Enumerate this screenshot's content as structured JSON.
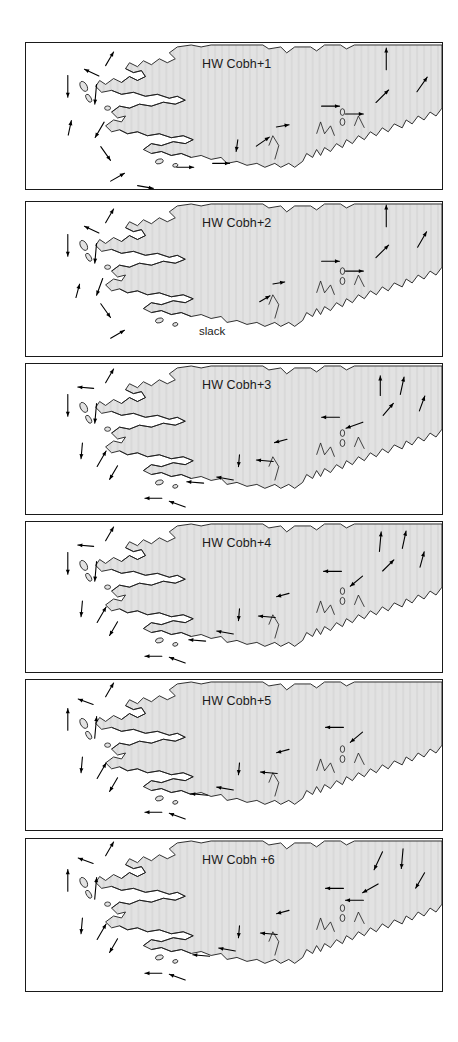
{
  "figure": {
    "title_implicit": "Tidal stream atlas relative to High Water Cobh",
    "width": 458,
    "height": 1042,
    "background_color": "#ffffff",
    "land_fill_color": "#e2e2e2",
    "coastline_color": "#1a1a1a",
    "arrow_color": "#000000",
    "panel_border_color": "#1a1a1a"
  },
  "panels": [
    {
      "id": "panel-1",
      "label": "HW Cobh+1",
      "annotation": "",
      "top": 42,
      "height": 148,
      "label_x": 176,
      "label_y": 14,
      "arrows": [
        {
          "x": 42,
          "y": 44,
          "angle": 90,
          "len": 22
        },
        {
          "x": 44,
          "y": 86,
          "angle": 282,
          "len": 15
        },
        {
          "x": 66,
          "y": 30,
          "angle": 205,
          "len": 16
        },
        {
          "x": 84,
          "y": 16,
          "angle": 300,
          "len": 16
        },
        {
          "x": 70,
          "y": 52,
          "angle": 95,
          "len": 20
        },
        {
          "x": 74,
          "y": 88,
          "angle": 120,
          "len": 18
        },
        {
          "x": 80,
          "y": 112,
          "angle": 55,
          "len": 17
        },
        {
          "x": 92,
          "y": 136,
          "angle": 330,
          "len": 16
        },
        {
          "x": 120,
          "y": 146,
          "angle": 10,
          "len": 16
        },
        {
          "x": 152,
          "y": 152,
          "angle": 5,
          "len": 16
        },
        {
          "x": 160,
          "y": 126,
          "angle": 0,
          "len": 17
        },
        {
          "x": 196,
          "y": 122,
          "angle": 0,
          "len": 17
        },
        {
          "x": 212,
          "y": 104,
          "angle": 98,
          "len": 12
        },
        {
          "x": 238,
          "y": 100,
          "angle": 325,
          "len": 16
        },
        {
          "x": 258,
          "y": 84,
          "angle": 350,
          "len": 13
        },
        {
          "x": 306,
          "y": 64,
          "angle": 0,
          "len": 18
        },
        {
          "x": 330,
          "y": 72,
          "angle": 0,
          "len": 18
        },
        {
          "x": 362,
          "y": 16,
          "angle": 270,
          "len": 22
        },
        {
          "x": 358,
          "y": 54,
          "angle": 315,
          "len": 18
        },
        {
          "x": 398,
          "y": 42,
          "angle": 305,
          "len": 18
        }
      ]
    },
    {
      "id": "panel-2",
      "label": "HW Cobh+2",
      "annotation": "slack",
      "annotation_x": 173,
      "annotation_y": 123,
      "top": 201,
      "height": 156,
      "label_x": 176,
      "label_y": 14,
      "arrows": [
        {
          "x": 42,
          "y": 44,
          "angle": 90,
          "len": 22
        },
        {
          "x": 66,
          "y": 28,
          "angle": 205,
          "len": 16
        },
        {
          "x": 84,
          "y": 14,
          "angle": 300,
          "len": 16
        },
        {
          "x": 70,
          "y": 52,
          "angle": 95,
          "len": 20
        },
        {
          "x": 74,
          "y": 86,
          "angle": 110,
          "len": 18
        },
        {
          "x": 52,
          "y": 90,
          "angle": 285,
          "len": 14
        },
        {
          "x": 80,
          "y": 110,
          "angle": 55,
          "len": 17
        },
        {
          "x": 92,
          "y": 134,
          "angle": 330,
          "len": 16
        },
        {
          "x": 240,
          "y": 98,
          "angle": 330,
          "len": 12
        },
        {
          "x": 254,
          "y": 82,
          "angle": 350,
          "len": 12
        },
        {
          "x": 306,
          "y": 60,
          "angle": 0,
          "len": 18
        },
        {
          "x": 330,
          "y": 70,
          "angle": 0,
          "len": 18
        },
        {
          "x": 362,
          "y": 14,
          "angle": 270,
          "len": 22
        },
        {
          "x": 358,
          "y": 50,
          "angle": 315,
          "len": 18
        },
        {
          "x": 398,
          "y": 38,
          "angle": 300,
          "len": 18
        }
      ]
    },
    {
      "id": "panel-3",
      "label": "HW Cobh+3",
      "annotation": "",
      "top": 363,
      "height": 152,
      "label_x": 176,
      "label_y": 14,
      "arrows": [
        {
          "x": 42,
          "y": 42,
          "angle": 90,
          "len": 22
        },
        {
          "x": 60,
          "y": 24,
          "angle": 185,
          "len": 16
        },
        {
          "x": 84,
          "y": 12,
          "angle": 300,
          "len": 16
        },
        {
          "x": 70,
          "y": 50,
          "angle": 95,
          "len": 20
        },
        {
          "x": 56,
          "y": 88,
          "angle": 95,
          "len": 16
        },
        {
          "x": 76,
          "y": 96,
          "angle": 300,
          "len": 18
        },
        {
          "x": 88,
          "y": 110,
          "angle": 120,
          "len": 16
        },
        {
          "x": 128,
          "y": 136,
          "angle": 180,
          "len": 17
        },
        {
          "x": 152,
          "y": 142,
          "angle": 200,
          "len": 17
        },
        {
          "x": 170,
          "y": 120,
          "angle": 185,
          "len": 17
        },
        {
          "x": 200,
          "y": 116,
          "angle": 190,
          "len": 17
        },
        {
          "x": 214,
          "y": 98,
          "angle": 95,
          "len": 12
        },
        {
          "x": 240,
          "y": 98,
          "angle": 185,
          "len": 17
        },
        {
          "x": 256,
          "y": 78,
          "angle": 165,
          "len": 13
        },
        {
          "x": 306,
          "y": 54,
          "angle": 180,
          "len": 18
        },
        {
          "x": 330,
          "y": 62,
          "angle": 160,
          "len": 18
        },
        {
          "x": 356,
          "y": 22,
          "angle": 270,
          "len": 20
        },
        {
          "x": 364,
          "y": 46,
          "angle": 310,
          "len": 16
        },
        {
          "x": 378,
          "y": 22,
          "angle": 282,
          "len": 18
        },
        {
          "x": 398,
          "y": 40,
          "angle": 290,
          "len": 16
        }
      ]
    },
    {
      "id": "panel-4",
      "label": "HW Cobh+4",
      "annotation": "",
      "top": 521,
      "height": 152,
      "label_x": 176,
      "label_y": 14,
      "arrows": [
        {
          "x": 42,
          "y": 42,
          "angle": 90,
          "len": 22
        },
        {
          "x": 60,
          "y": 24,
          "angle": 185,
          "len": 16
        },
        {
          "x": 84,
          "y": 12,
          "angle": 300,
          "len": 16
        },
        {
          "x": 70,
          "y": 50,
          "angle": 95,
          "len": 20
        },
        {
          "x": 56,
          "y": 88,
          "angle": 95,
          "len": 16
        },
        {
          "x": 76,
          "y": 94,
          "angle": 300,
          "len": 18
        },
        {
          "x": 88,
          "y": 108,
          "angle": 120,
          "len": 16
        },
        {
          "x": 128,
          "y": 136,
          "angle": 180,
          "len": 17
        },
        {
          "x": 152,
          "y": 140,
          "angle": 200,
          "len": 17
        },
        {
          "x": 172,
          "y": 120,
          "angle": 185,
          "len": 17
        },
        {
          "x": 200,
          "y": 112,
          "angle": 190,
          "len": 17
        },
        {
          "x": 214,
          "y": 94,
          "angle": 95,
          "len": 12
        },
        {
          "x": 242,
          "y": 96,
          "angle": 185,
          "len": 17
        },
        {
          "x": 258,
          "y": 74,
          "angle": 165,
          "len": 13
        },
        {
          "x": 308,
          "y": 50,
          "angle": 180,
          "len": 18
        },
        {
          "x": 332,
          "y": 60,
          "angle": 140,
          "len": 16
        },
        {
          "x": 356,
          "y": 20,
          "angle": 275,
          "len": 20
        },
        {
          "x": 364,
          "y": 44,
          "angle": 315,
          "len": 16
        },
        {
          "x": 380,
          "y": 18,
          "angle": 282,
          "len": 18
        },
        {
          "x": 398,
          "y": 38,
          "angle": 285,
          "len": 16
        }
      ]
    },
    {
      "id": "panel-5",
      "label": "HW Cobh+5",
      "annotation": "",
      "top": 679,
      "height": 152,
      "label_x": 176,
      "label_y": 14,
      "arrows": [
        {
          "x": 42,
          "y": 40,
          "angle": 270,
          "len": 22
        },
        {
          "x": 60,
          "y": 22,
          "angle": 200,
          "len": 16
        },
        {
          "x": 84,
          "y": 10,
          "angle": 300,
          "len": 16
        },
        {
          "x": 70,
          "y": 48,
          "angle": 275,
          "len": 22
        },
        {
          "x": 56,
          "y": 86,
          "angle": 95,
          "len": 16
        },
        {
          "x": 76,
          "y": 92,
          "angle": 300,
          "len": 18
        },
        {
          "x": 88,
          "y": 106,
          "angle": 120,
          "len": 16
        },
        {
          "x": 128,
          "y": 134,
          "angle": 180,
          "len": 17
        },
        {
          "x": 152,
          "y": 138,
          "angle": 200,
          "len": 17
        },
        {
          "x": 174,
          "y": 116,
          "angle": 185,
          "len": 17
        },
        {
          "x": 200,
          "y": 110,
          "angle": 190,
          "len": 17
        },
        {
          "x": 214,
          "y": 90,
          "angle": 95,
          "len": 12
        },
        {
          "x": 244,
          "y": 94,
          "angle": 185,
          "len": 17
        },
        {
          "x": 258,
          "y": 72,
          "angle": 165,
          "len": 13
        },
        {
          "x": 310,
          "y": 48,
          "angle": 180,
          "len": 18
        },
        {
          "x": 332,
          "y": 58,
          "angle": 140,
          "len": 16
        }
      ]
    },
    {
      "id": "panel-6",
      "label": "HW Cobh +6",
      "annotation": "",
      "top": 838,
      "height": 154,
      "label_x": 176,
      "label_y": 14,
      "arrows": [
        {
          "x": 42,
          "y": 42,
          "angle": 270,
          "len": 22
        },
        {
          "x": 60,
          "y": 22,
          "angle": 200,
          "len": 16
        },
        {
          "x": 84,
          "y": 10,
          "angle": 300,
          "len": 16
        },
        {
          "x": 70,
          "y": 50,
          "angle": 275,
          "len": 22
        },
        {
          "x": 56,
          "y": 88,
          "angle": 95,
          "len": 16
        },
        {
          "x": 76,
          "y": 94,
          "angle": 300,
          "len": 18
        },
        {
          "x": 88,
          "y": 108,
          "angle": 120,
          "len": 16
        },
        {
          "x": 128,
          "y": 136,
          "angle": 180,
          "len": 17
        },
        {
          "x": 152,
          "y": 140,
          "angle": 200,
          "len": 17
        },
        {
          "x": 176,
          "y": 118,
          "angle": 185,
          "len": 17
        },
        {
          "x": 202,
          "y": 112,
          "angle": 190,
          "len": 17
        },
        {
          "x": 214,
          "y": 94,
          "angle": 95,
          "len": 12
        },
        {
          "x": 244,
          "y": 96,
          "angle": 185,
          "len": 17
        },
        {
          "x": 258,
          "y": 74,
          "angle": 165,
          "len": 13
        },
        {
          "x": 310,
          "y": 50,
          "angle": 180,
          "len": 18
        },
        {
          "x": 330,
          "y": 62,
          "angle": 180,
          "len": 18
        },
        {
          "x": 354,
          "y": 22,
          "angle": 115,
          "len": 20
        },
        {
          "x": 346,
          "y": 50,
          "angle": 150,
          "len": 18
        },
        {
          "x": 378,
          "y": 20,
          "angle": 95,
          "len": 20
        },
        {
          "x": 396,
          "y": 42,
          "angle": 120,
          "len": 18
        }
      ]
    }
  ]
}
